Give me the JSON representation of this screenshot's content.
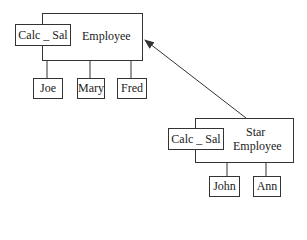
{
  "diagram": {
    "type": "object-inheritance-diagram",
    "objects": [
      {
        "name": "Employee",
        "method": "Calc _ Sal",
        "instances": [
          "Joe",
          "Mary",
          "Fred"
        ]
      },
      {
        "name_line1": "Star",
        "name_line2": "Employee",
        "method": "Calc _ Sal",
        "instances": [
          "John",
          "Ann"
        ]
      }
    ],
    "relationship": {
      "from": "Star Employee",
      "to": "Employee",
      "kind": "inherits-arrow"
    }
  }
}
